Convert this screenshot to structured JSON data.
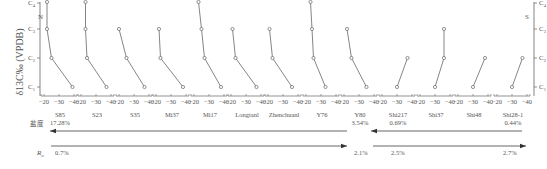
{
  "chart_data": {
    "type": "line",
    "title": "",
    "ylabel": "δ13C‰ (VPDB)",
    "y_categories": [
      "C1",
      "C2",
      "C3",
      "C4"
    ],
    "x_ticks": [
      "-20",
      "-30",
      "-40"
    ],
    "xlim": [
      -17,
      -42
    ],
    "left_direction_label": "N",
    "right_direction_label": "S",
    "grid": false,
    "series": [
      {
        "name": "S85",
        "sublabel": "17.28%",
        "values": {
          "C1": -39,
          "C2": -25,
          "C3": -22,
          "C4": -22
        }
      },
      {
        "name": "S23",
        "sublabel": "",
        "values": {
          "C1": -37,
          "C2": -24,
          "C3": -23,
          "C4": -23
        }
      },
      {
        "name": "S35",
        "sublabel": "",
        "values": {
          "C1": -37,
          "C2": -25,
          "C3": -20
        }
      },
      {
        "name": "Mi37",
        "sublabel": "",
        "values": {
          "C1": -38,
          "C2": -23,
          "C3": -22
        }
      },
      {
        "name": "Mi17",
        "sublabel": "",
        "values": {
          "C1": -38,
          "C2": -27,
          "C3": -25,
          "C4": -23
        }
      },
      {
        "name": "Longtanl",
        "sublabel": "",
        "values": {
          "C1": -37,
          "C2": -23,
          "C3": -21
        }
      },
      {
        "name": "Zhenchuanl",
        "sublabel": "",
        "values": {
          "C1": -36,
          "C2": -23,
          "C3": -21
        }
      },
      {
        "name": "Y76",
        "sublabel": "",
        "values": {
          "C1": -33,
          "C2": -25,
          "C3": -24,
          "C4": -23
        }
      },
      {
        "name": "Y80",
        "sublabel": "3.54%",
        "values": {
          "C1": -35,
          "C2": -25,
          "C3": -22
        }
      },
      {
        "name": "Shi217",
        "sublabel": "0.69%",
        "values": {
          "C1": -30,
          "C2": -37
        }
      },
      {
        "name": "Shi37",
        "sublabel": "",
        "values": {
          "C1": -30,
          "C2": -36,
          "C3": -36
        }
      },
      {
        "name": "Shi48",
        "sublabel": "",
        "values": {
          "C1": -30,
          "C2": -38
        }
      },
      {
        "name": "Shi28-1",
        "sublabel": "0.44%",
        "values": {
          "C1": -30,
          "C2": -37
        }
      }
    ],
    "annotations": {
      "salinity_label": "盐度",
      "ro_label": "Ro",
      "salinity_arrows": [
        {
          "from": "Y80",
          "to": "S85",
          "direction": "left"
        },
        {
          "from": "Shi28-1",
          "to": "Shi217",
          "direction": "left"
        }
      ],
      "ro_arrows": [
        {
          "start_label": "0.7%",
          "end_label": "2.1%",
          "direction": "right"
        },
        {
          "start_label": "2.5%",
          "end_label": "2.7%",
          "direction": "right"
        }
      ]
    }
  },
  "labels": {
    "north": "N",
    "south": "S",
    "ylabel": "δ13C‰ (VPDB)",
    "salinity": "盐度",
    "ro": "Ro",
    "ro_values": [
      "0.7%",
      "2.1%",
      "2.5%",
      "2.7%"
    ]
  }
}
